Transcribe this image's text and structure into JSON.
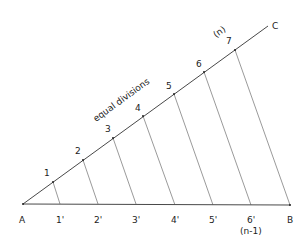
{
  "diagram": {
    "points": {
      "A": "A",
      "B": "B",
      "C": "C"
    },
    "annotation": "equal divisions",
    "upper_labels": [
      "1",
      "2",
      "3",
      "4",
      "5",
      "6",
      "7"
    ],
    "upper_n_label": "(n)",
    "lower_labels": [
      "1'",
      "2'",
      "3'",
      "4'",
      "5'",
      "6'"
    ],
    "lower_n_label": "(n-1)"
  }
}
